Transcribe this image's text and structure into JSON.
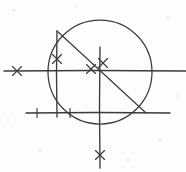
{
  "figure": {
    "ink_color": "#3b3b3f",
    "background_color": "#fdfdfd",
    "canvas": {
      "width": 186,
      "height": 172
    }
  },
  "chart_data": {
    "type": "diagram",
    "xlabel": "",
    "ylabel": "",
    "xlim": [
      0,
      186
    ],
    "ylim": [
      0,
      172
    ],
    "grid": false,
    "legend": "none",
    "shapes": [
      {
        "name": "main-circle",
        "kind": "circle",
        "cx": 100,
        "cy": 72,
        "r": 52,
        "stroke": "#3b3b3f",
        "stroke_width": 1.25
      },
      {
        "name": "upper-horizontal-line",
        "kind": "line",
        "x1": 4,
        "y1": 71,
        "x2": 186,
        "y2": 71,
        "stroke": "#3b3b3f",
        "stroke_width": 1.35
      },
      {
        "name": "lower-horizontal-line",
        "kind": "line",
        "x1": 26,
        "y1": 113,
        "x2": 170,
        "y2": 113,
        "stroke": "#3b3b3f",
        "stroke_width": 1.35
      },
      {
        "name": "left-vertical-line",
        "kind": "line",
        "x1": 57,
        "y1": 31,
        "x2": 57,
        "y2": 117,
        "stroke": "#3b3b3f",
        "stroke_width": 1.35
      },
      {
        "name": "center-vertical-line",
        "kind": "line",
        "x1": 100,
        "y1": 47,
        "x2": 100,
        "y2": 168,
        "stroke": "#3b3b3f",
        "stroke_width": 1.35
      },
      {
        "name": "diagonal-chord",
        "kind": "line",
        "x1": 57,
        "y1": 31,
        "x2": 146,
        "y2": 113,
        "stroke": "#3b3b3f",
        "stroke_width": 1.2
      }
    ],
    "tick_marks": [
      {
        "name": "x-mark-left-horizontal",
        "style": "cross",
        "x": 17,
        "y": 71,
        "size": 9,
        "on": "upper-horizontal-line"
      },
      {
        "name": "x-mark-left-vertical",
        "style": "cross",
        "x": 57,
        "y": 59,
        "size": 9,
        "on": "left-vertical-line"
      },
      {
        "name": "x-mark-on-chord",
        "style": "cross",
        "x": 91,
        "y": 69,
        "size": 9,
        "on": "diagonal-chord"
      },
      {
        "name": "x-mark-center-vertical",
        "style": "cross",
        "x": 103,
        "y": 63,
        "size": 9,
        "on": "center-vertical-line"
      },
      {
        "name": "x-mark-bottom-vertical",
        "style": "cross",
        "x": 100,
        "y": 155,
        "size": 9,
        "on": "center-vertical-line"
      },
      {
        "name": "tick-lower-left",
        "style": "dash",
        "x": 37,
        "y": 113,
        "size": 9,
        "on": "lower-horizontal-line"
      },
      {
        "name": "tick-lower-middle",
        "style": "dash",
        "x": 70,
        "y": 113,
        "size": 9,
        "on": "lower-horizontal-line"
      }
    ],
    "intersections": [
      {
        "name": "circle-center",
        "x": 100,
        "y": 72
      },
      {
        "name": "chord-top-endpoint",
        "x": 57,
        "y": 31
      },
      {
        "name": "chord-bottom-endpoint",
        "x": 146,
        "y": 113
      }
    ]
  }
}
